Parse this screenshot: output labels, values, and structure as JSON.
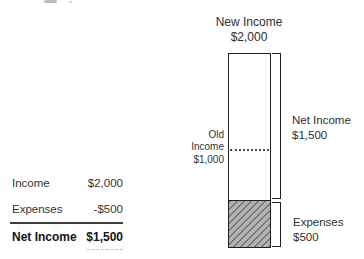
{
  "summary_table": {
    "rows": [
      {
        "label": "Income",
        "value": "$2,000"
      },
      {
        "label": "Expenses",
        "value": "-$500"
      },
      {
        "label": "Net Income",
        "value": "$1,500"
      }
    ]
  },
  "chart": {
    "title": {
      "line1": "New Income",
      "line2": "$2,000"
    },
    "old_income": {
      "line1": "Old",
      "line2": "Income",
      "line3": "$1,000"
    },
    "net_income": {
      "line1": "Net Income",
      "line2": "$1,500"
    },
    "expenses": {
      "line1": "Expenses",
      "line2": "$500"
    }
  },
  "chart_data": {
    "type": "bar",
    "title": "New Income $2,000",
    "categories": [
      "New Income"
    ],
    "series": [
      {
        "name": "Net Income",
        "values": [
          1500
        ],
        "fill": "white",
        "segment": "top"
      },
      {
        "name": "Expenses",
        "values": [
          500
        ],
        "fill": "gray-diagonal-hatch",
        "segment": "bottom"
      }
    ],
    "total": 2000,
    "ylim": [
      0,
      2000
    ],
    "grid": false,
    "legend_position": "none",
    "reference_line": {
      "label": "Old Income",
      "value": 1000,
      "style": "dotted"
    },
    "annotations": [
      {
        "text": "New Income $2,000",
        "position": "above bar, centered"
      },
      {
        "text": "Old Income $1,000",
        "position": "left of bar at 1000 level"
      },
      {
        "text": "Net Income $1,500",
        "position": "right bracket spanning 500-2000"
      },
      {
        "text": "Expenses $500",
        "position": "right bracket spanning 0-500"
      }
    ]
  },
  "colors": {
    "text": "#333333",
    "text_bold": "#141414",
    "bar_border": "#1f1f1f",
    "hatch_background": "#b3b3b3",
    "hatch_line": "#6f6f6f",
    "dotted_line": "#4a4a4a",
    "table_divider": "#3f3f3f",
    "value_underline": "#c4c4c4"
  }
}
